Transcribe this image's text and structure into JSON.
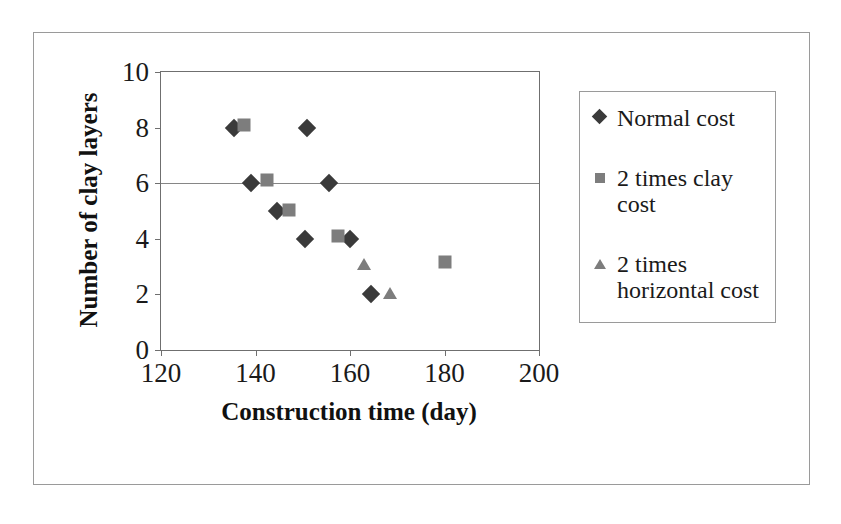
{
  "chart_data": {
    "type": "scatter",
    "title": "",
    "xlabel": "Construction time (day)",
    "ylabel": "Number of clay layers",
    "xlim": [
      120,
      200
    ],
    "ylim": [
      0,
      10
    ],
    "xticks": [
      "120",
      "140",
      "160",
      "180",
      "200"
    ],
    "yticks": [
      "0",
      "2",
      "4",
      "6",
      "8",
      "10"
    ],
    "xtick_values": [
      120,
      140,
      160,
      180,
      200
    ],
    "ytick_values": [
      0,
      2,
      4,
      6,
      8,
      10
    ],
    "grid": "horizontal gridline at y=6 only",
    "legend_position": "right, outside plot",
    "series": [
      {
        "name": "Normal cost",
        "marker": "diamond",
        "color": "#3a3a3a",
        "points": [
          {
            "x": 135.5,
            "y": 8
          },
          {
            "x": 151,
            "y": 8
          },
          {
            "x": 139,
            "y": 6
          },
          {
            "x": 155.5,
            "y": 6
          },
          {
            "x": 144.5,
            "y": 5
          },
          {
            "x": 150.5,
            "y": 4
          },
          {
            "x": 160,
            "y": 4
          },
          {
            "x": 164.5,
            "y": 2
          }
        ]
      },
      {
        "name": "2 times clay cost",
        "marker": "square",
        "color": "#7d7d7d",
        "points": [
          {
            "x": 137.5,
            "y": 8.1
          },
          {
            "x": 142.5,
            "y": 6.1
          },
          {
            "x": 147,
            "y": 5.05
          },
          {
            "x": 157.5,
            "y": 4.1
          },
          {
            "x": 180,
            "y": 3.15
          }
        ]
      },
      {
        "name": "2 times horizontal cost",
        "marker": "triangle",
        "color": "#7d7d7d",
        "points": [
          {
            "x": 163,
            "y": 3.1
          },
          {
            "x": 168.5,
            "y": 2.05
          }
        ]
      }
    ]
  },
  "legend": {
    "items": [
      {
        "label": "Normal cost",
        "marker": "diamond"
      },
      {
        "label": "2 times clay cost",
        "marker": "square"
      },
      {
        "label": "2 times horizontal cost",
        "marker": "triangle"
      }
    ]
  }
}
